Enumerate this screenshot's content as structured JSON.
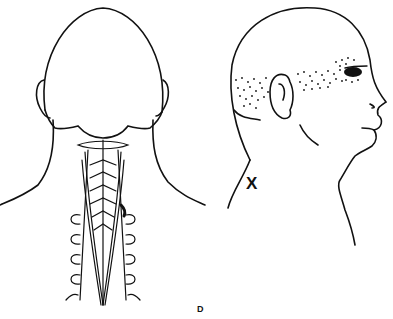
{
  "figure": {
    "panel_label": "D",
    "marker_label": "X",
    "views": [
      {
        "name": "posterior-head-neck",
        "description": "Back view of head and neck with cervical vertebrae and posterior neck muscles"
      },
      {
        "name": "lateral-head",
        "description": "Right lateral view of head showing stippled referred pain zone from occiput through ear to eye"
      }
    ],
    "colors": {
      "line": "#111111",
      "background": "#ffffff"
    }
  }
}
